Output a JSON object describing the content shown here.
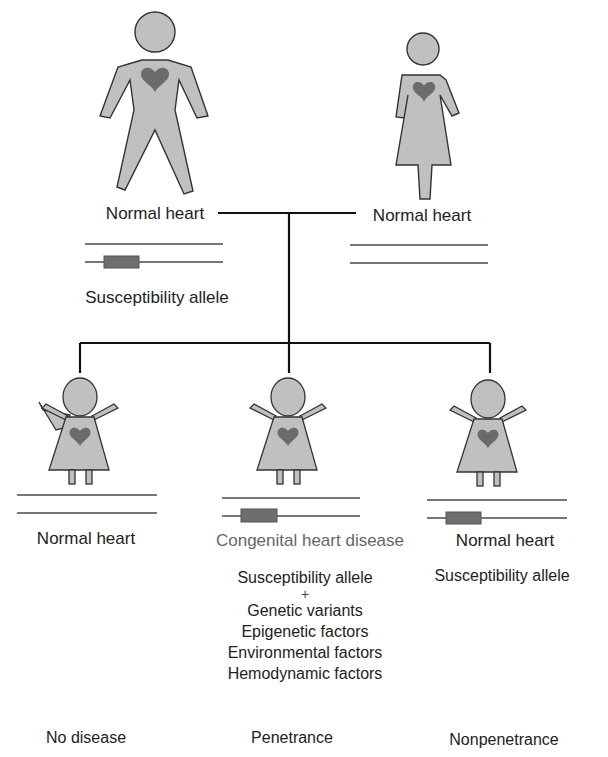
{
  "colors": {
    "figure_fill": "#c0c0c0",
    "figure_stroke": "#333333",
    "heart": "#6b6b6b",
    "chromosome_line": "#777777",
    "allele_box": "#6e6e6e",
    "pedigree_line": "#111111"
  },
  "parents": {
    "father": {
      "icon": "male-figure-icon",
      "label": "Normal heart",
      "chromosomes": [
        "normal",
        "susceptibility"
      ],
      "allele_label": "Susceptibility allele"
    },
    "mother": {
      "icon": "female-figure-icon",
      "label": "Normal heart",
      "chromosomes": [
        "normal",
        "normal"
      ]
    }
  },
  "children": [
    {
      "icon": "child-figure-icon",
      "label": "Normal heart",
      "chromosomes": [
        "normal",
        "normal"
      ],
      "outcome": "No disease"
    },
    {
      "icon": "child-figure-icon",
      "label": "Congenital heart disease",
      "chromosomes": [
        "normal",
        "susceptibility"
      ],
      "factors": {
        "first": "Susceptibility allele",
        "plus": "+",
        "items": [
          "Genetic variants",
          "Epigenetic factors",
          "Environmental factors",
          "Hemodynamic factors"
        ]
      },
      "outcome": "Penetrance"
    },
    {
      "icon": "child-figure-icon",
      "label": "Normal heart",
      "chromosomes": [
        "normal",
        "susceptibility"
      ],
      "allele_label": "Susceptibility allele",
      "outcome": "Nonpenetrance"
    }
  ]
}
